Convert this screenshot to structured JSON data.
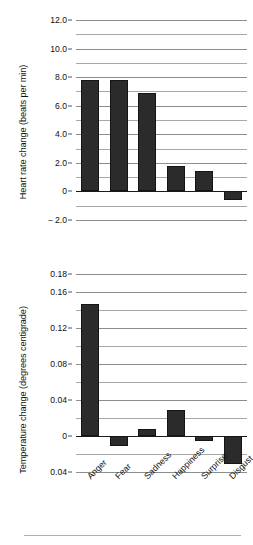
{
  "figure": {
    "background": "#ffffff",
    "bar_color": "#2b2b2b",
    "grid_color": "#9a9a9a",
    "axis_color": "#1a1a1a"
  },
  "chart_data": [
    {
      "type": "bar",
      "title": "",
      "xlabel": "",
      "ylabel": "Heart rate change (beats per min)",
      "categories": [
        "Anger",
        "Fear",
        "Sadness",
        "Happiness",
        "Surprise",
        "Disgust"
      ],
      "values": [
        7.8,
        7.8,
        6.9,
        1.8,
        1.45,
        -0.6
      ],
      "ylim": [
        -2.0,
        12.0
      ],
      "ytick_labels": [
        "12.0",
        "10.0",
        "8.0",
        "6.0",
        "4.0",
        "2.0",
        "0",
        "− 2.0"
      ],
      "ytick_values": [
        12.0,
        10.0,
        8.0,
        6.0,
        4.0,
        2.0,
        0,
        -2.0
      ],
      "minor_tick_values": [
        11.0,
        9.0,
        7.0,
        5.0,
        3.0,
        1.0,
        -1.0
      ],
      "grid": true,
      "legend": "none",
      "show_xticklabels": false
    },
    {
      "type": "bar",
      "title": "",
      "xlabel": "",
      "ylabel": "Temperature change (degrees centigrade)",
      "categories": [
        "Anger",
        "Fear",
        "Sadness",
        "Happiness",
        "Surprise",
        "Disgust"
      ],
      "values": [
        0.147,
        -0.011,
        0.008,
        0.029,
        -0.006,
        -0.031
      ],
      "ylim": [
        -0.04,
        0.18
      ],
      "ytick_labels": [
        "0.18",
        "0.16",
        "0.12",
        "0.08",
        "0.04",
        "0",
        "0.04"
      ],
      "ytick_values": [
        0.18,
        0.16,
        0.12,
        0.08,
        0.04,
        0,
        -0.04
      ],
      "minor_tick_values": [
        0.14,
        0.1,
        0.06,
        0.02,
        -0.02
      ],
      "grid": true,
      "legend": "none",
      "show_xticklabels": true
    }
  ]
}
